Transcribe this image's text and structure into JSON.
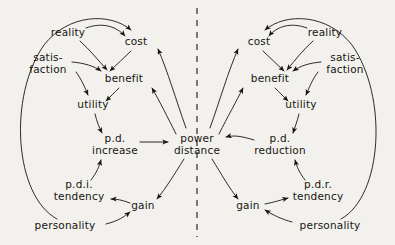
{
  "figure": {
    "title": "",
    "background_color": "#f2f1ee",
    "ink_color": "#17150f",
    "divider": {
      "name": "center-dashed-divider",
      "orientation": "vertical",
      "style": "dashed",
      "x": 197
    }
  },
  "center": {
    "label_line1": "power",
    "label_line2": "distance",
    "x": 197,
    "y": 144
  },
  "left_side": {
    "name": "power-distance-increase-loop",
    "nodes": [
      {
        "id": "l-reality",
        "label": "reality",
        "x": 68,
        "y": 33
      },
      {
        "id": "l-cost",
        "label": "cost",
        "x": 136,
        "y": 42
      },
      {
        "id": "l-satisfaction",
        "line1": "satis-",
        "line2": "faction",
        "x": 48,
        "y": 63
      },
      {
        "id": "l-benefit",
        "label": "benefit",
        "x": 124,
        "y": 79
      },
      {
        "id": "l-utility",
        "label": "utility",
        "x": 93,
        "y": 105
      },
      {
        "id": "l-pd-increase",
        "line1": "p.d.",
        "line2": "increase",
        "x": 115,
        "y": 144
      },
      {
        "id": "l-pdi-tendency",
        "line1": "p.d.i.",
        "line2": "tendency",
        "x": 79,
        "y": 190
      },
      {
        "id": "l-gain",
        "label": "gain",
        "x": 143,
        "y": 206
      },
      {
        "id": "l-personality",
        "label": "personality",
        "x": 65,
        "y": 226
      }
    ],
    "edges": [
      {
        "from": "reality",
        "to": "cost",
        "shape": "diagonal"
      },
      {
        "from": "reality",
        "to": "benefit",
        "shape": "diagonal"
      },
      {
        "from": "cost",
        "to": "benefit",
        "shape": "diagonal"
      },
      {
        "from": "satisfaction",
        "to": "benefit",
        "shape": "curve"
      },
      {
        "from": "satisfaction",
        "to": "utility",
        "shape": "curve"
      },
      {
        "from": "benefit",
        "to": "utility",
        "shape": "diagonal"
      },
      {
        "from": "utility",
        "to": "p.d. increase",
        "shape": "curve"
      },
      {
        "from": "p.d. increase",
        "to": "power distance",
        "shape": "straight"
      },
      {
        "from": "p.d.i. tendency",
        "to": "p.d. increase",
        "shape": "curve"
      },
      {
        "from": "gain",
        "to": "p.d.i. tendency",
        "shape": "curve"
      },
      {
        "from": "personality",
        "to": "gain",
        "shape": "curve"
      },
      {
        "from": "personality",
        "to": "cost",
        "shape": "outer-loop"
      },
      {
        "from": "power distance",
        "to": "cost",
        "shape": "outer-curve"
      },
      {
        "from": "power distance",
        "to": "benefit",
        "shape": "outer-curve"
      },
      {
        "from": "power distance",
        "to": "gain",
        "shape": "curve"
      }
    ]
  },
  "right_side": {
    "name": "power-distance-reduction-loop",
    "nodes": [
      {
        "id": "r-cost",
        "label": "cost",
        "x": 259,
        "y": 42
      },
      {
        "id": "r-reality",
        "label": "reality",
        "x": 325,
        "y": 33
      },
      {
        "id": "r-benefit",
        "label": "benefit",
        "x": 270,
        "y": 79
      },
      {
        "id": "r-satisfaction",
        "line1": "satis-",
        "line2": "faction",
        "x": 345,
        "y": 63
      },
      {
        "id": "r-utility",
        "label": "utility",
        "x": 301,
        "y": 105
      },
      {
        "id": "r-pd-reduction",
        "line1": "p.d.",
        "line2": "reduction",
        "x": 280,
        "y": 144
      },
      {
        "id": "r-pdr-tendency",
        "line1": "p.d.r.",
        "line2": "tendency",
        "x": 318,
        "y": 190
      },
      {
        "id": "r-gain",
        "label": "gain",
        "x": 248,
        "y": 206
      },
      {
        "id": "r-personality",
        "label": "personality",
        "x": 330,
        "y": 226
      }
    ],
    "edges": [
      {
        "from": "reality",
        "to": "cost",
        "shape": "diagonal"
      },
      {
        "from": "reality",
        "to": "benefit",
        "shape": "diagonal"
      },
      {
        "from": "cost",
        "to": "benefit",
        "shape": "diagonal"
      },
      {
        "from": "satisfaction",
        "to": "benefit",
        "shape": "curve"
      },
      {
        "from": "satisfaction",
        "to": "utility",
        "shape": "curve"
      },
      {
        "from": "benefit",
        "to": "utility",
        "shape": "diagonal"
      },
      {
        "from": "utility",
        "to": "p.d. reduction",
        "shape": "curve"
      },
      {
        "from": "p.d. reduction",
        "to": "power distance",
        "shape": "curve"
      },
      {
        "from": "p.d.r. tendency",
        "to": "p.d. reduction",
        "shape": "curve"
      },
      {
        "from": "gain",
        "to": "p.d.r. tendency",
        "shape": "curve"
      },
      {
        "from": "personality",
        "to": "gain",
        "shape": "curve"
      },
      {
        "from": "personality",
        "to": "cost",
        "shape": "outer-loop"
      },
      {
        "from": "power distance",
        "to": "cost",
        "shape": "outer-curve"
      },
      {
        "from": "power distance",
        "to": "benefit",
        "shape": "outer-curve"
      },
      {
        "from": "power distance",
        "to": "gain",
        "shape": "curve"
      }
    ]
  }
}
